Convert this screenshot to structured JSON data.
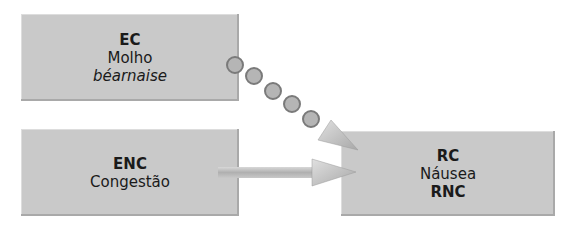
{
  "diagram": {
    "type": "conditioning-flow",
    "nodes": {
      "ec": {
        "line1": "EC",
        "line2": "Molho",
        "line3": "béarnaise"
      },
      "enc": {
        "line1": "ENC",
        "line2": "Congestão"
      },
      "rc": {
        "line1": "RC",
        "line2": "Náusea",
        "line3": "RNC"
      }
    },
    "edges": [
      {
        "from": "ec",
        "to": "rc",
        "style": "dotted-circles",
        "circle_count": 5
      },
      {
        "from": "enc",
        "to": "rc",
        "style": "solid-block-arrow"
      }
    ],
    "colors": {
      "box_fill": "#c9c9c9",
      "circle_fill": "#b5b5b5",
      "circle_stroke": "#7a7a7a",
      "arrow_fill": "#bcbcbc"
    }
  }
}
